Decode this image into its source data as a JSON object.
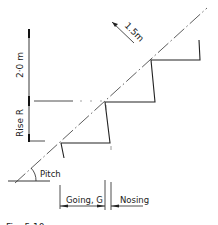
{
  "diagram": {
    "labels": {
      "pitch_line_length": "1.5m",
      "headroom": "2·0 m",
      "rise": "Rise  R",
      "pitch": "Pitch",
      "going": "Going, G",
      "nosing": "Nosing"
    },
    "caption": "Fig. 5.10",
    "colors": {
      "line": "#222222",
      "background": "#ffffff"
    }
  }
}
